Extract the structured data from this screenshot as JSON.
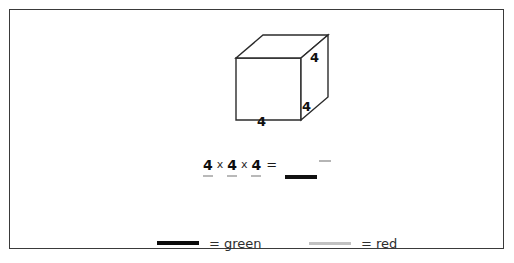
{
  "worksheet": {
    "figure": {
      "shape_name": "cube",
      "dimension_labels": {
        "right_top": "4",
        "right_bottom": "4",
        "bottom": "4"
      }
    },
    "equation": {
      "factor1": "4",
      "operator1": "x",
      "factor2": "4",
      "operator2": "x",
      "factor3": "4",
      "equals": "=",
      "answer": ""
    },
    "legend": {
      "items": [
        {
          "key": "green",
          "equals": "=",
          "label": "green",
          "color": "#0b0b0b"
        },
        {
          "key": "red",
          "equals": "=",
          "label": "red",
          "color": "#c2c2c2"
        }
      ],
      "green_text": "= green",
      "red_text": "= red"
    },
    "colors": {
      "frame_border": "#3a3a3a",
      "cube_stroke": "#2b2b2b",
      "background": "#ffffff",
      "green_mark": "#0b0b0b",
      "red_mark": "#b9b9b9"
    }
  }
}
